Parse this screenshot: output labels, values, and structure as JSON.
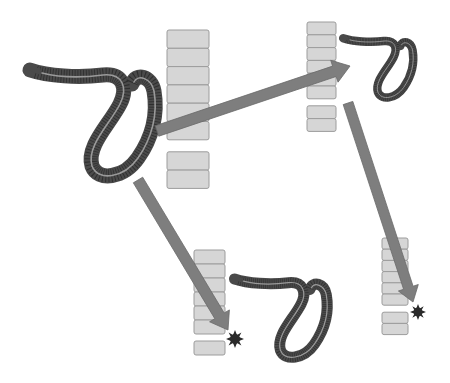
{
  "diagram": {
    "colors": {
      "background": "#ffffff",
      "segment_fill": "#d6d6d6",
      "segment_border": "#9c9c9c",
      "arrow": "#7e7e7e",
      "worm": "#4a4a4a",
      "worm_stripe": "#9a9a9a",
      "star": "#2a2a2a"
    },
    "worms": [
      {
        "id": "worm-large-left",
        "x": 28,
        "y": 66,
        "scale": 1.0
      },
      {
        "id": "worm-small-top-right",
        "x": 340,
        "y": 36,
        "scale": 0.55
      },
      {
        "id": "worm-medium-bottom",
        "x": 232,
        "y": 276,
        "scale": 0.72
      }
    ],
    "segment_stacks": [
      {
        "id": "stack-top-left",
        "x": 167,
        "y": 30,
        "w": 42,
        "h": 18.3,
        "upper": 6,
        "gap": 12,
        "lower": 2
      },
      {
        "id": "stack-top-right",
        "x": 307,
        "y": 22,
        "w": 29,
        "h": 12.8,
        "upper": 6,
        "gap": 7,
        "lower": 2
      },
      {
        "id": "stack-bottom-left",
        "x": 194,
        "y": 250,
        "w": 31,
        "h": 14,
        "upper": 6,
        "gap": 7,
        "lower": 1
      },
      {
        "id": "stack-bottom-right",
        "x": 382,
        "y": 238,
        "w": 26,
        "h": 11.2,
        "upper": 6,
        "gap": 7,
        "lower": 2
      }
    ],
    "arrows": [
      {
        "id": "arrow-to-top-right",
        "from": [
          157,
          131
        ],
        "to": [
          350,
          66
        ],
        "width": 11
      },
      {
        "id": "arrow-to-bottom-left",
        "from": [
          138,
          180
        ],
        "to": [
          228,
          330
        ],
        "width": 11
      },
      {
        "id": "arrow-to-bottom-right",
        "from": [
          348,
          103
        ],
        "to": [
          413,
          302
        ],
        "width": 10
      }
    ],
    "markers": [
      {
        "id": "cut-star-bottom-left",
        "x": 235,
        "y": 339,
        "r": 9
      },
      {
        "id": "cut-star-bottom-right",
        "x": 418,
        "y": 312,
        "r": 8
      }
    ]
  }
}
